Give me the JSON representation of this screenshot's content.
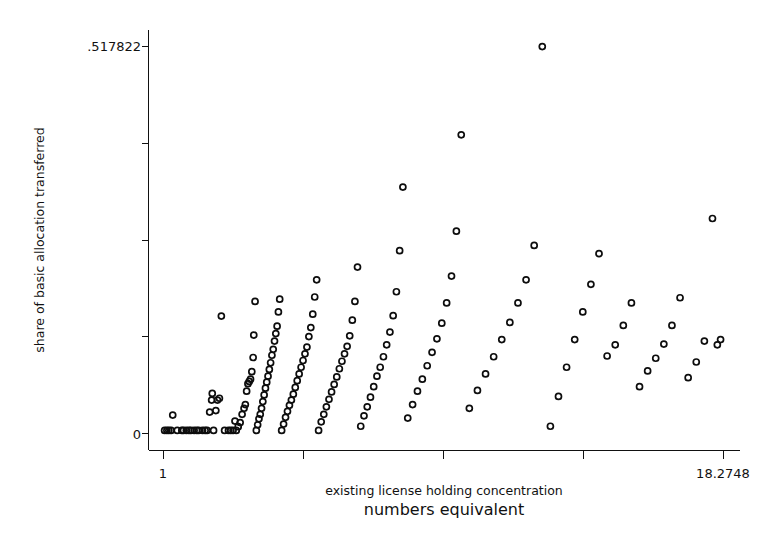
{
  "chart_data": {
    "type": "scatter",
    "title": "",
    "xlabel": "existing license holding concentration",
    "xlabel_secondary": "numbers equivalent",
    "ylabel": "share of basic allocation transferred",
    "xlim": [
      1,
      18.2748
    ],
    "ylim": [
      0,
      0.517822
    ],
    "x_tick_labels": [
      "1",
      "18.2748"
    ],
    "y_tick_labels": [
      ".517822",
      "0"
    ],
    "x_ticks": [
      1,
      5.3187,
      9.6374,
      13.9561,
      18.2748
    ],
    "y_ticks": [
      0,
      0.1294555,
      0.258911,
      0.3883665,
      0.517822
    ],
    "grid": false,
    "legend": false,
    "marker": "open-circle",
    "marker_color": "#0d0d0d",
    "n_points": 168,
    "points": [
      [
        1.05,
        0.0035
      ],
      [
        1.12,
        0.0035
      ],
      [
        1.18,
        0.0035
      ],
      [
        1.25,
        0.0035
      ],
      [
        1.3,
        0.024
      ],
      [
        1.44,
        0.0035
      ],
      [
        1.58,
        0.0035
      ],
      [
        1.63,
        0.0035
      ],
      [
        1.72,
        0.0035
      ],
      [
        1.8,
        0.0035
      ],
      [
        1.86,
        0.0035
      ],
      [
        1.96,
        0.0035
      ],
      [
        2.04,
        0.0035
      ],
      [
        2.1,
        0.0035
      ],
      [
        2.22,
        0.0035
      ],
      [
        2.3,
        0.0035
      ],
      [
        2.36,
        0.0035
      ],
      [
        2.44,
        0.028
      ],
      [
        2.5,
        0.044
      ],
      [
        2.52,
        0.053
      ],
      [
        2.56,
        0.0035
      ],
      [
        2.63,
        0.03
      ],
      [
        2.68,
        0.044
      ],
      [
        2.74,
        0.0465
      ],
      [
        2.8,
        0.1565
      ],
      [
        2.9,
        0.0035
      ],
      [
        3.02,
        0.0035
      ],
      [
        3.09,
        0.0035
      ],
      [
        3.16,
        0.0035
      ],
      [
        3.22,
        0.016
      ],
      [
        3.26,
        0.0035
      ],
      [
        3.32,
        0.0085
      ],
      [
        3.38,
        0.014
      ],
      [
        3.44,
        0.025
      ],
      [
        3.5,
        0.033
      ],
      [
        3.54,
        0.038
      ],
      [
        3.58,
        0.056
      ],
      [
        3.62,
        0.066
      ],
      [
        3.66,
        0.069
      ],
      [
        3.7,
        0.072
      ],
      [
        3.74,
        0.082
      ],
      [
        3.78,
        0.101
      ],
      [
        3.8,
        0.131
      ],
      [
        3.84,
        0.176
      ],
      [
        3.88,
        0.0035
      ],
      [
        3.92,
        0.011
      ],
      [
        3.96,
        0.019
      ],
      [
        4.0,
        0.025
      ],
      [
        4.04,
        0.033
      ],
      [
        4.08,
        0.042
      ],
      [
        4.12,
        0.051
      ],
      [
        4.16,
        0.06
      ],
      [
        4.2,
        0.068
      ],
      [
        4.24,
        0.076
      ],
      [
        4.28,
        0.085
      ],
      [
        4.32,
        0.094
      ],
      [
        4.36,
        0.104
      ],
      [
        4.4,
        0.112
      ],
      [
        4.44,
        0.123
      ],
      [
        4.48,
        0.133
      ],
      [
        4.52,
        0.143
      ],
      [
        4.56,
        0.162
      ],
      [
        4.6,
        0.179
      ],
      [
        4.66,
        0.0035
      ],
      [
        4.72,
        0.012
      ],
      [
        4.78,
        0.021
      ],
      [
        4.84,
        0.029
      ],
      [
        4.9,
        0.037
      ],
      [
        4.96,
        0.044
      ],
      [
        5.02,
        0.052
      ],
      [
        5.08,
        0.061
      ],
      [
        5.14,
        0.07
      ],
      [
        5.2,
        0.079
      ],
      [
        5.26,
        0.088
      ],
      [
        5.32,
        0.097
      ],
      [
        5.38,
        0.106
      ],
      [
        5.44,
        0.115
      ],
      [
        5.5,
        0.129
      ],
      [
        5.56,
        0.141
      ],
      [
        5.62,
        0.159
      ],
      [
        5.68,
        0.182
      ],
      [
        5.74,
        0.205
      ],
      [
        5.8,
        0.0035
      ],
      [
        5.88,
        0.015
      ],
      [
        5.96,
        0.025
      ],
      [
        6.04,
        0.035
      ],
      [
        6.12,
        0.045
      ],
      [
        6.2,
        0.055
      ],
      [
        6.28,
        0.065
      ],
      [
        6.36,
        0.075
      ],
      [
        6.44,
        0.086
      ],
      [
        6.52,
        0.096
      ],
      [
        6.6,
        0.106
      ],
      [
        6.68,
        0.116
      ],
      [
        6.76,
        0.13
      ],
      [
        6.84,
        0.151
      ],
      [
        6.92,
        0.176
      ],
      [
        7.0,
        0.222
      ],
      [
        7.1,
        0.009
      ],
      [
        7.2,
        0.023
      ],
      [
        7.3,
        0.035
      ],
      [
        7.4,
        0.048
      ],
      [
        7.5,
        0.062
      ],
      [
        7.6,
        0.076
      ],
      [
        7.7,
        0.088
      ],
      [
        7.8,
        0.102
      ],
      [
        7.9,
        0.118
      ],
      [
        8.0,
        0.135
      ],
      [
        8.1,
        0.157
      ],
      [
        8.2,
        0.189
      ],
      [
        8.3,
        0.244
      ],
      [
        8.4,
        0.329
      ],
      [
        8.55,
        0.02
      ],
      [
        8.7,
        0.038
      ],
      [
        8.85,
        0.056
      ],
      [
        9.0,
        0.072
      ],
      [
        9.15,
        0.09
      ],
      [
        9.3,
        0.108
      ],
      [
        9.45,
        0.126
      ],
      [
        9.6,
        0.147
      ],
      [
        9.75,
        0.174
      ],
      [
        9.9,
        0.21
      ],
      [
        10.05,
        0.27
      ],
      [
        10.2,
        0.399
      ],
      [
        10.45,
        0.033
      ],
      [
        10.7,
        0.057
      ],
      [
        10.95,
        0.079
      ],
      [
        11.2,
        0.102
      ],
      [
        11.45,
        0.125
      ],
      [
        11.7,
        0.148
      ],
      [
        11.95,
        0.174
      ],
      [
        12.2,
        0.205
      ],
      [
        12.45,
        0.251
      ],
      [
        12.7,
        0.517
      ],
      [
        12.95,
        0.009
      ],
      [
        13.2,
        0.049
      ],
      [
        13.45,
        0.088
      ],
      [
        13.7,
        0.125
      ],
      [
        13.95,
        0.162
      ],
      [
        14.2,
        0.199
      ],
      [
        14.45,
        0.24
      ],
      [
        14.7,
        0.103
      ],
      [
        14.95,
        0.118
      ],
      [
        15.2,
        0.144
      ],
      [
        15.45,
        0.174
      ],
      [
        15.7,
        0.062
      ],
      [
        15.95,
        0.083
      ],
      [
        16.2,
        0.1
      ],
      [
        16.45,
        0.119
      ],
      [
        16.7,
        0.144
      ],
      [
        16.95,
        0.181
      ],
      [
        17.2,
        0.074
      ],
      [
        17.45,
        0.095
      ],
      [
        17.7,
        0.123
      ],
      [
        17.95,
        0.287
      ],
      [
        18.1,
        0.118
      ],
      [
        18.2,
        0.125
      ]
    ]
  },
  "axes": {
    "y_top_label": ".517822",
    "y_bottom_label": "0",
    "x_left_label": "1",
    "x_right_label": "18.2748",
    "y_axis_title": "share of basic allocation transferred",
    "x_axis_title": "existing license holding concentration",
    "x_axis_subtitle": "numbers equivalent"
  }
}
